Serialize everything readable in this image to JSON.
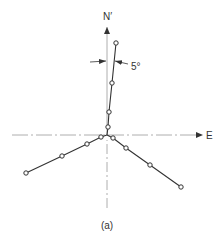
{
  "diagram": {
    "caption": "(a)",
    "axes": {
      "north_label": "N′",
      "east_label": "E"
    },
    "angle_annotation": "5°",
    "colors": {
      "line": "#333333",
      "axis": "#888888",
      "marker_fill": "#ffffff"
    },
    "branches": [
      {
        "name": "north-branch",
        "points": [
          [
            107,
            135
          ],
          [
            108,
            127
          ],
          [
            109,
            112
          ],
          [
            112,
            83
          ],
          [
            116,
            43
          ]
        ]
      },
      {
        "name": "southwest-branch",
        "points": [
          [
            107,
            135
          ],
          [
            101,
            137
          ],
          [
            87,
            144
          ],
          [
            62,
            156
          ],
          [
            26,
            173
          ]
        ]
      },
      {
        "name": "southeast-branch",
        "points": [
          [
            107,
            135
          ],
          [
            113,
            138
          ],
          [
            126,
            148
          ],
          [
            150,
            165
          ],
          [
            181,
            187
          ]
        ]
      }
    ]
  }
}
